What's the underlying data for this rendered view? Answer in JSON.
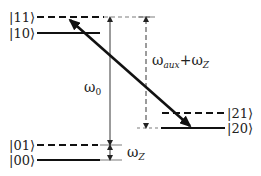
{
  "diagram": {
    "type": "energy-level-diagram",
    "levels": [
      {
        "id": "11",
        "label": "|11⟩",
        "style": "dashed"
      },
      {
        "id": "10",
        "label": "|10⟩",
        "style": "solid"
      },
      {
        "id": "01",
        "label": "|01⟩",
        "style": "dashed"
      },
      {
        "id": "00",
        "label": "|00⟩",
        "style": "solid"
      },
      {
        "id": "21",
        "label": "|21⟩",
        "style": "dashed"
      },
      {
        "id": "20",
        "label": "|20⟩",
        "style": "solid"
      }
    ],
    "annotations": {
      "omega0": {
        "base": "ω",
        "sub": "0"
      },
      "omega_aux_z": {
        "base1": "ω",
        "sub1": "aux",
        "plus": "+",
        "base2": "ω",
        "sub2": "Z"
      },
      "omega_z": {
        "base": "ω",
        "sub": "Z"
      }
    },
    "transition": {
      "from": "|20⟩",
      "to": "|11⟩",
      "style": "bold double-headed arrow"
    },
    "colors": {
      "line": "#111111",
      "text": "#222222"
    }
  }
}
